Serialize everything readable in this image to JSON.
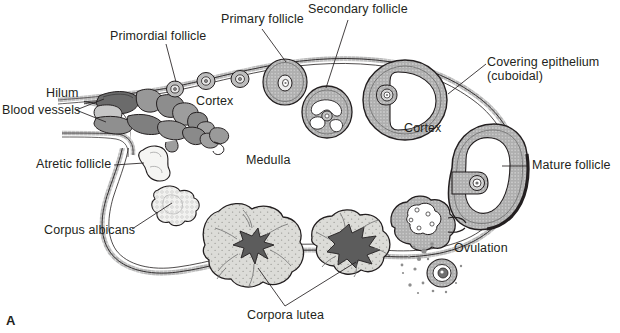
{
  "figure": {
    "panel_letter": "A",
    "title_alt": "Histologic structure of the ovary"
  },
  "labels": {
    "primordial_follicle": "Primordial follicle",
    "primary_follicle": "Primary follicle",
    "secondary_follicle": "Secondary follicle",
    "covering_epithelium_line1": "Covering epithelium",
    "covering_epithelium_line2": "(cuboidal)",
    "hilum": "Hilum",
    "blood_vessels": "Blood vessels",
    "cortex_left": "Cortex",
    "cortex_right": "Cortex",
    "medulla": "Medulla",
    "atretic_follicle": "Atretic follicle",
    "corpus_albicans": "Corpus albicans",
    "corpora_lutea": "Corpora lutea",
    "mature_follicle": "Mature follicle",
    "ovulation": "Ovulation"
  },
  "colors": {
    "outline": "#231f20",
    "text": "#231f20",
    "epithelium_fill": "#d9d9d9",
    "stroma_fill": "#ffffff",
    "corpus_luteum_fill": "#d5d5d2",
    "corpus_luteum_core": "#6e6e6e",
    "vessel_dark": "#5a5a5a",
    "vessel_mid": "#8a8a8a",
    "vessel_light": "#b5b5b5",
    "follicle_granulosa": "#b8b8b8",
    "antrum_fill": "#ffffff",
    "background": "#ffffff"
  }
}
